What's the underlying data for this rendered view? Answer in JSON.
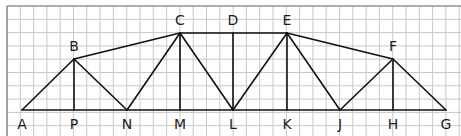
{
  "diagram": {
    "type": "truss",
    "grid": {
      "x0": 7,
      "y0": 6,
      "width": 454,
      "height": 130,
      "step": 13.3,
      "color": "#c8c8c8",
      "border_color": "#777777"
    },
    "line_color": "#111111",
    "nodes": {
      "A": {
        "x": 22,
        "y": 110,
        "label_pos": "below"
      },
      "P": {
        "x": 74,
        "y": 110,
        "label_pos": "below"
      },
      "N": {
        "x": 127,
        "y": 110,
        "label_pos": "below"
      },
      "M": {
        "x": 180,
        "y": 110,
        "label_pos": "below"
      },
      "L": {
        "x": 233,
        "y": 110,
        "label_pos": "below"
      },
      "K": {
        "x": 287,
        "y": 110,
        "label_pos": "below"
      },
      "J": {
        "x": 340,
        "y": 110,
        "label_pos": "below"
      },
      "H": {
        "x": 393,
        "y": 110,
        "label_pos": "below"
      },
      "G": {
        "x": 446,
        "y": 110,
        "label_pos": "below"
      },
      "B": {
        "x": 74,
        "y": 59,
        "label_pos": "above"
      },
      "C": {
        "x": 180,
        "y": 33,
        "label_pos": "above"
      },
      "D": {
        "x": 233,
        "y": 33,
        "label_pos": "above"
      },
      "E": {
        "x": 287,
        "y": 33,
        "label_pos": "above"
      },
      "F": {
        "x": 393,
        "y": 59,
        "label_pos": "above"
      }
    },
    "members": [
      [
        "A",
        "G"
      ],
      [
        "A",
        "B"
      ],
      [
        "B",
        "C"
      ],
      [
        "C",
        "E"
      ],
      [
        "E",
        "F"
      ],
      [
        "F",
        "G"
      ],
      [
        "B",
        "P"
      ],
      [
        "B",
        "N"
      ],
      [
        "N",
        "C"
      ],
      [
        "C",
        "M"
      ],
      [
        "C",
        "L"
      ],
      [
        "D",
        "L"
      ],
      [
        "L",
        "E"
      ],
      [
        "E",
        "K"
      ],
      [
        "E",
        "J"
      ],
      [
        "J",
        "F"
      ],
      [
        "F",
        "H"
      ]
    ]
  }
}
